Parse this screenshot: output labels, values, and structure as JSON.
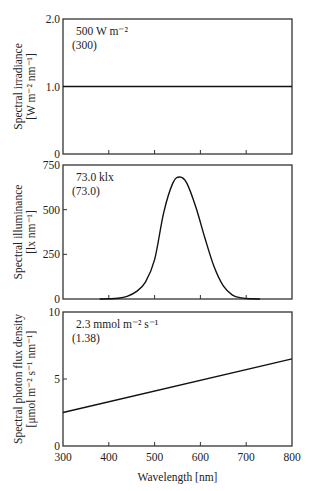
{
  "chart_data": [
    {
      "type": "line",
      "title": "",
      "annotation": [
        "500 W m⁻²",
        "(300)"
      ],
      "ylabel": [
        "Spectral irradiance",
        "[W m⁻² nm⁻¹]"
      ],
      "xlabel": "",
      "xlim": [
        300,
        800
      ],
      "ylim": [
        0,
        2.0
      ],
      "yticks": [
        0,
        1.0,
        2.0
      ],
      "ytick_labels": [
        "0",
        "1.0",
        "2.0"
      ],
      "xticks": [
        300,
        400,
        500,
        600,
        700,
        800
      ],
      "grid": false,
      "series": [
        {
          "name": "spectral irradiance",
          "x": [
            300,
            800
          ],
          "y": [
            1.0,
            1.0
          ]
        }
      ]
    },
    {
      "type": "line",
      "title": "",
      "annotation": [
        "73.0 klx",
        "(73.0)"
      ],
      "ylabel": [
        "Spectral illuminance",
        "[lx nm⁻¹]"
      ],
      "xlabel": "",
      "xlim": [
        300,
        800
      ],
      "ylim": [
        0,
        750
      ],
      "yticks": [
        0,
        250,
        500,
        750
      ],
      "ytick_labels": [
        "0",
        "250",
        "500",
        "750"
      ],
      "xticks": [
        300,
        400,
        500,
        600,
        700,
        800
      ],
      "grid": false,
      "series": [
        {
          "name": "spectral illuminance",
          "x": [
            380,
            400,
            420,
            440,
            460,
            480,
            500,
            520,
            540,
            555,
            570,
            590,
            610,
            630,
            650,
            670,
            690,
            710,
            730
          ],
          "y": [
            0,
            1,
            4,
            15,
            41,
            95,
            220,
            485,
            650,
            683,
            650,
            515,
            340,
            180,
            73,
            22,
            6,
            1,
            0
          ]
        }
      ]
    },
    {
      "type": "line",
      "title": "",
      "annotation": [
        "2.3 mmol m⁻² s⁻¹",
        "(1.38)"
      ],
      "ylabel": [
        "Spectral photon flux density",
        "[μmol m⁻² s⁻¹ nm⁻¹]"
      ],
      "xlabel": "Wavelength [nm]",
      "xlim": [
        300,
        800
      ],
      "ylim": [
        0,
        10
      ],
      "yticks": [
        0,
        5,
        10
      ],
      "ytick_labels": [
        "0",
        "5",
        "10"
      ],
      "xticks": [
        300,
        400,
        500,
        600,
        700,
        800
      ],
      "xtick_labels": [
        "300",
        "400",
        "500",
        "600",
        "700",
        "800"
      ],
      "grid": false,
      "series": [
        {
          "name": "spectral photon flux density",
          "x": [
            300,
            800
          ],
          "y": [
            2.5,
            6.5
          ]
        }
      ]
    }
  ]
}
